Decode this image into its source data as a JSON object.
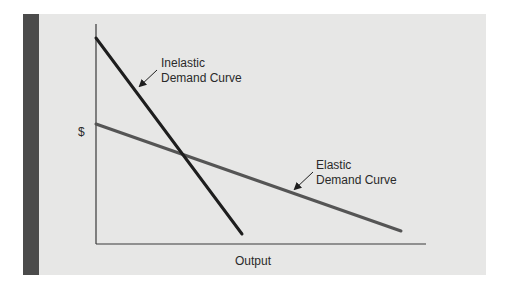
{
  "diagram": {
    "title": "",
    "y_axis_label": "$",
    "x_axis_label": "Output",
    "colors": {
      "panel_background": "#e7e7e6",
      "side_bar": "#4b4b4b",
      "axis": "#3a3a3a",
      "inelastic_curve": "#1e1e1e",
      "elastic_curve": "#555555",
      "text": "#2a2a2a"
    },
    "curves": [
      {
        "id": "inelastic",
        "label_line1": "Inelastic",
        "label_line2": "Demand Curve",
        "description": "Steep downward-sloping line"
      },
      {
        "id": "elastic",
        "label_line1": "Elastic",
        "label_line2": "Demand Curve",
        "description": "Shallow downward-sloping line"
      }
    ]
  }
}
